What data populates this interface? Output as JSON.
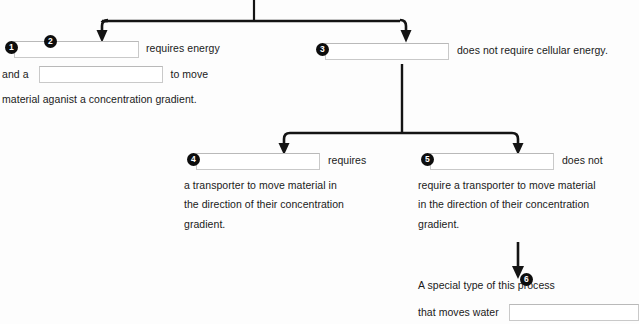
{
  "diagram": {
    "ink_color": "#141414",
    "blank_border_color": "#c9c9c9",
    "bubble_color": "#0d0d0d",
    "bubble_text_color": "#ffffff",
    "nodes": [
      {
        "id": "node-1",
        "bubble": "1",
        "lines": [
          {
            "before": "",
            "blank": true,
            "after": "requires energy"
          },
          {
            "before": "and a",
            "blank": true,
            "after": "to move"
          },
          {
            "before": "material aganist a concentration gradient.",
            "blank": false,
            "after": ""
          }
        ]
      },
      {
        "id": "node-3",
        "bubble": "3",
        "lines": [
          {
            "before": "",
            "blank": true,
            "after": "does  not require cellular energy."
          }
        ]
      },
      {
        "id": "node-4",
        "bubble": "4",
        "lines": [
          {
            "before": "",
            "blank": true,
            "after": "requires"
          },
          {
            "before": "a transporter to move material in",
            "blank": false,
            "after": ""
          },
          {
            "before": "the direction of their concentration",
            "blank": false,
            "after": ""
          },
          {
            "before": "gradient.",
            "blank": false,
            "after": ""
          }
        ]
      },
      {
        "id": "node-5",
        "bubble": "5",
        "lines": [
          {
            "before": "",
            "blank": true,
            "after": "does not"
          },
          {
            "before": "require a transporter to move material",
            "blank": false,
            "after": ""
          },
          {
            "before": "in the direction of their concentration",
            "blank": false,
            "after": ""
          },
          {
            "before": "gradient.",
            "blank": false,
            "after": ""
          }
        ]
      },
      {
        "id": "node-6",
        "bubble": "6",
        "lines": [
          {
            "before": "A special type of this process",
            "blank": false,
            "after": ""
          },
          {
            "before": "that moves water",
            "blank": true,
            "after": ""
          }
        ]
      }
    ],
    "text": {
      "n1_l1_after": "requires energy",
      "n1_l2_before": "and a",
      "n1_l2_after": "to move",
      "n1_l3": "material aganist a concentration gradient.",
      "n3_l1_after": "does  not require cellular energy.",
      "n4_l1_after": "requires",
      "n4_l2": "a transporter to move material in",
      "n4_l3": "the direction of their concentration",
      "n4_l4": "gradient.",
      "n5_l1_after": "does not",
      "n5_l2": "require a transporter to move material",
      "n5_l3": "in the direction of their concentration",
      "n5_l4": "gradient.",
      "n6_l1": "A special type of this process",
      "n6_l2_before": "that moves water"
    },
    "bubbles": {
      "one": "1",
      "two": "2",
      "three": "3",
      "four": "4",
      "five": "5",
      "six": "6"
    },
    "blank_values": {
      "one": "",
      "two": "",
      "three": "",
      "four": "",
      "five": "",
      "six": ""
    },
    "blank_placeholders": {
      "one": "",
      "two": "",
      "three": "",
      "four": "",
      "five": "",
      "six": ""
    }
  }
}
